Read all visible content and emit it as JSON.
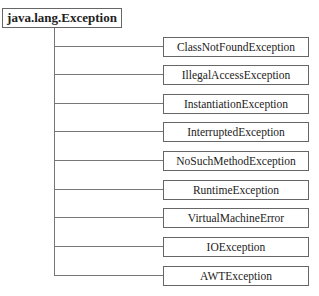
{
  "diagram": {
    "root": {
      "label": "java.lang.Exception"
    },
    "children": [
      {
        "label": "ClassNotFoundException"
      },
      {
        "label": "IllegalAccessException"
      },
      {
        "label": "InstantiationException"
      },
      {
        "label": "InterruptedException"
      },
      {
        "label": "NoSuchMethodException"
      },
      {
        "label": "RuntimeException"
      },
      {
        "label": "VirtualMachineError"
      },
      {
        "label": "IOException"
      },
      {
        "label": "AWTException"
      }
    ]
  }
}
